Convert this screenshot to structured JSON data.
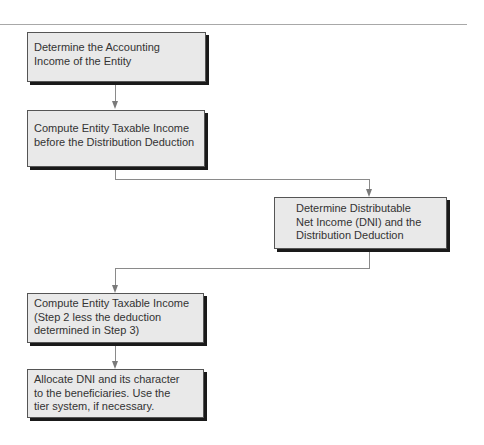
{
  "diagram": {
    "type": "flowchart",
    "steps": [
      {
        "id": 1,
        "label": "Determine the Accounting Income of the Entity",
        "lines": [
          "Determine the Accounting",
          "Income of the Entity"
        ]
      },
      {
        "id": 2,
        "label": "Compute Entity Taxable Income before the Distribution Deduction",
        "lines": [
          "Compute Entity Taxable Income",
          "before the Distribution Deduction"
        ]
      },
      {
        "id": 3,
        "label": "Determine Distributable Net Income (DNI) and the Distribution Deduction",
        "lines": [
          "Determine Distributable",
          "Net Income (DNI) and the",
          "Distribution Deduction"
        ]
      },
      {
        "id": 4,
        "label": "Compute Entity Taxable Income (Step 2 less the deduction determined in Step 3)",
        "lines": [
          "Compute Entity Taxable Income",
          "(Step 2 less the deduction",
          "determined in Step 3)"
        ]
      },
      {
        "id": 5,
        "label": "Allocate DNI and its character to the beneficiaries. Use the tier system, if necessary.",
        "lines": [
          "Allocate DNI and its character",
          "to the beneficiaries. Use the",
          "tier system, if necessary."
        ]
      }
    ],
    "edges": [
      {
        "from": 1,
        "to": 2
      },
      {
        "from": 2,
        "to": 3
      },
      {
        "from": 3,
        "to": 4
      },
      {
        "from": 4,
        "to": 5
      }
    ],
    "colors": {
      "box_fill": "#e9e9e9",
      "box_border": "#555555",
      "shadow": "#1a1a1a",
      "connector": "#8a8a8a",
      "text": "#333333"
    }
  }
}
